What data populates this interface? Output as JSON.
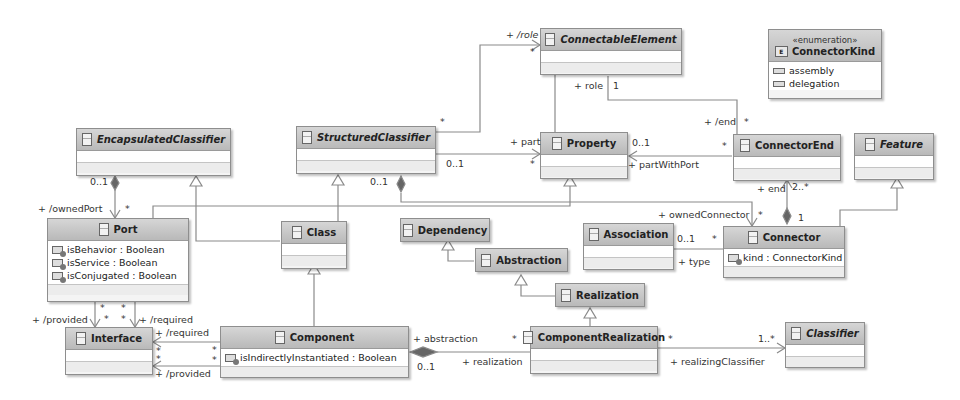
{
  "diagram": {
    "type": "UML class diagram",
    "colors": {
      "header": "#c4c4c4",
      "body": "#ffffff",
      "line": "#8a8a8a",
      "text": "#222222"
    }
  },
  "classes": {
    "connectable_element": {
      "name": "ConnectableElement",
      "abstract": true
    },
    "connector_kind": {
      "stereotype": "«enumeration»",
      "name": "ConnectorKind",
      "literals": [
        "assembly",
        "delegation"
      ]
    },
    "encapsulated_classifier": {
      "name": "EncapsulatedClassifier",
      "abstract": true
    },
    "structured_classifier": {
      "name": "StructuredClassifier",
      "abstract": true
    },
    "property": {
      "name": "Property",
      "abstract": false
    },
    "connector_end": {
      "name": "ConnectorEnd",
      "abstract": false
    },
    "feature": {
      "name": "Feature",
      "abstract": true
    },
    "port": {
      "name": "Port",
      "attributes": [
        "isBehavior : Boolean",
        "isService : Boolean",
        "isConjugated : Boolean"
      ]
    },
    "class": {
      "name": "Class"
    },
    "dependency": {
      "name": "Dependency"
    },
    "abstraction": {
      "name": "Abstraction"
    },
    "realization": {
      "name": "Realization"
    },
    "association": {
      "name": "Association"
    },
    "connector": {
      "name": "Connector",
      "attributes": [
        "kind : ConnectorKind"
      ]
    },
    "interface": {
      "name": "Interface"
    },
    "component": {
      "name": "Component",
      "attributes": [
        "isIndirectlyInstantiated : Boolean"
      ]
    },
    "component_realization": {
      "name": "ComponentRealization"
    },
    "classifier": {
      "name": "Classifier",
      "abstract": true
    }
  },
  "labels": {
    "role_derived": "+ /role",
    "role_derived_mult": "*",
    "sc_role_mult": "*",
    "role": "+ role",
    "role_mult": "1",
    "end_derived": "+ /end",
    "end_derived_mult": "*",
    "part": "+ part",
    "part_mult": "*",
    "sc_part_mult": "0..1",
    "part_with_port_mult": "0..1",
    "part_with_port": "+ partWithPort",
    "ce_pwp_mult": "*",
    "ec_owned_mult": "0..1",
    "owned_port": "+ /ownedPort",
    "owned_port_mult": "*",
    "sc_conn_mult": "0..1",
    "owned_connector": "+ ownedConnector",
    "owned_connector_mult": "*",
    "end": "+ end",
    "end_mult": "2..*",
    "conn_end_owner_mult": "1",
    "assoc_mult": "0..1",
    "conn_type_mult": "*",
    "type": "+ type",
    "port_prov_mult1": "*",
    "port_prov_mult2": "*",
    "port_req_mult1": "*",
    "port_req_mult2": "*",
    "provided_port": "+ /provided",
    "required_port": "+ /required",
    "required_comp": "+ /required",
    "provided_comp": "+ /provided",
    "iface_req_mult": "*",
    "iface_prov_mult": "*",
    "comp_req_mult": "*",
    "comp_prov_mult": "*",
    "abstraction": "+ abstraction",
    "abstraction_mult": "0..1",
    "realization": "+ realization",
    "realization_mult": "*",
    "cr_mult": "*",
    "realizing_classifier": "+ realizingClassifier",
    "realizing_classifier_mult": "1..*"
  }
}
